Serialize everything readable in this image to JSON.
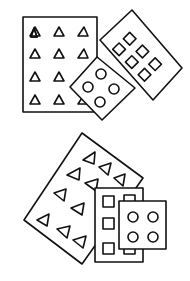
{
  "illustration": {
    "description": "Hand-drawn line illustration of two groups of overlapping blister-pack style cards",
    "stroke_color": "#111111",
    "background_color": "#ffffff",
    "groups": [
      {
        "name": "top-group",
        "cards": [
          {
            "name": "triangle-card",
            "shape": "triangle",
            "rows": 4,
            "cols": 3
          },
          {
            "name": "square-card-rotated",
            "shape": "square",
            "rows": 3,
            "cols": 2
          },
          {
            "name": "circle-card-rotated",
            "shape": "circle",
            "rows": 2,
            "cols": 2
          }
        ]
      },
      {
        "name": "bottom-group",
        "cards": [
          {
            "name": "triangle-card-rotated",
            "shape": "triangle",
            "rows": 4,
            "cols": 3
          },
          {
            "name": "square-card",
            "shape": "square",
            "rows": 3,
            "cols": 2
          },
          {
            "name": "circle-card",
            "shape": "circle",
            "rows": 2,
            "cols": 2
          }
        ]
      }
    ]
  }
}
